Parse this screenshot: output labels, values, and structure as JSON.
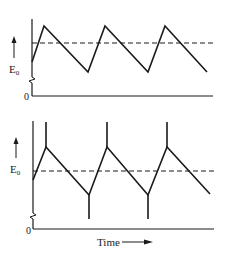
{
  "figure": {
    "top_panel": {
      "ylabel": "E",
      "ylabel_sub": "0",
      "origin_label": "0",
      "waveform": "sawtooth",
      "reference_line": "dashed"
    },
    "bottom_panel": {
      "ylabel": "E",
      "ylabel_sub": "0",
      "origin_label": "0",
      "waveform": "sawtooth with spikes",
      "reference_line": "dashed",
      "xlabel": "Time"
    },
    "colors": {
      "line": "#1a1a1a",
      "background": "#ffffff"
    }
  }
}
